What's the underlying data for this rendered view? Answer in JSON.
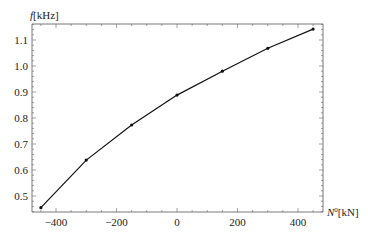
{
  "chart_data": {
    "type": "line",
    "title": "",
    "xlabel": "N^0[kN]",
    "ylabel": "f[kHz]",
    "xlim": [
      -470,
      485
    ],
    "ylim": [
      0.435,
      1.16
    ],
    "x_ticks": [
      -400,
      -200,
      0,
      200,
      400
    ],
    "x_tick_labels": [
      "−400",
      "−200",
      "0",
      "200",
      "400"
    ],
    "y_ticks": [
      0.5,
      0.6,
      0.7,
      0.8,
      0.9,
      1.0,
      1.1
    ],
    "y_tick_labels": [
      "0.5",
      "0.6",
      "0.7",
      "0.8",
      "0.9",
      "1.0",
      "1.1"
    ],
    "grid": false,
    "series": [
      {
        "name": "f",
        "color": "#111111",
        "markers": true,
        "x": [
          -450,
          -300,
          -150,
          0,
          150,
          300,
          450
        ],
        "y": [
          0.455,
          0.638,
          0.773,
          0.888,
          0.98,
          1.068,
          1.142
        ]
      }
    ]
  },
  "labels": {
    "y_axis_var": "f",
    "y_axis_unit": "[kHz]",
    "x_axis_var": "N",
    "x_axis_sup": "0",
    "x_axis_unit": "[kN]"
  }
}
